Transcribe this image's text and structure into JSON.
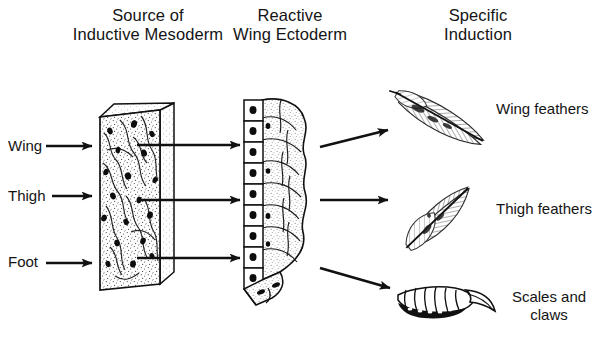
{
  "figure": {
    "background_color": "#ffffff",
    "ink_color": "#111111",
    "width": 610,
    "height": 339
  },
  "headings": {
    "column1": "Source of\nInductive Mesoderm",
    "column2": "Reactive\nWing Ectoderm",
    "column3": "Specific\nInduction"
  },
  "inputs": [
    {
      "label": "Wing",
      "arrow": "right-arrow"
    },
    {
      "label": "Thigh",
      "arrow": "right-arrow"
    },
    {
      "label": "Foot",
      "arrow": "right-arrow"
    }
  ],
  "transfer_arrows": [
    {
      "name": "wing-transfer-arrow",
      "direction": "right"
    },
    {
      "name": "thigh-transfer-arrow",
      "direction": "right"
    },
    {
      "name": "foot-transfer-arrow",
      "direction": "right"
    }
  ],
  "induction_arrows": [
    {
      "name": "wing-induction-arrow",
      "direction": "up-right"
    },
    {
      "name": "thigh-induction-arrow",
      "direction": "right"
    },
    {
      "name": "foot-induction-arrow",
      "direction": "down-right"
    }
  ],
  "outputs": [
    {
      "label": "Wing feathers",
      "icon": "long-pennaceous-feather-icon"
    },
    {
      "label": "Thigh feathers",
      "icon": "short-downy-feather-icon"
    },
    {
      "label": "Scales and\nclaws",
      "icon": "scaly-toe-claw-icon"
    }
  ],
  "specimens": {
    "mesoderm_block": {
      "name": "inductive-mesoderm-slab",
      "description": "Stippled three-dimensional slab of mesenchyme with scattered dark nuclei and fibrous strands",
      "nuclei_count": 18
    },
    "ectoderm_block": {
      "name": "reactive-wing-ectoderm-block",
      "description": "Columnar epithelial cell layer with dark basal nuclei backed by rounded stippled mesenchymal cells",
      "epithelial_cells": 9
    }
  }
}
